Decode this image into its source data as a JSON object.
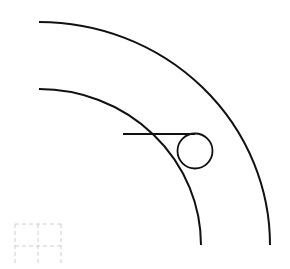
{
  "diagram": {
    "title": "",
    "background": "#ffffff",
    "stroke_color": "#111111",
    "grid_color": "#c8c8c8",
    "outer_arc": {
      "start": [
        39,
        22
      ],
      "end": [
        270,
        245
      ],
      "rx": 231,
      "ry": 223
    },
    "inner_arc": {
      "start": [
        39,
        89
      ],
      "end": [
        201,
        245
      ],
      "rx": 162,
      "ry": 156
    },
    "tangent_line": {
      "start": [
        123,
        134
      ],
      "end": [
        195,
        134
      ]
    },
    "circle": {
      "cx": 195,
      "cy": 151,
      "r": 17.5
    },
    "dashed_grid": {
      "x": 15,
      "y": 224,
      "cols": 2,
      "rows": 2,
      "cell_w": 23,
      "cell_h": 22
    }
  }
}
